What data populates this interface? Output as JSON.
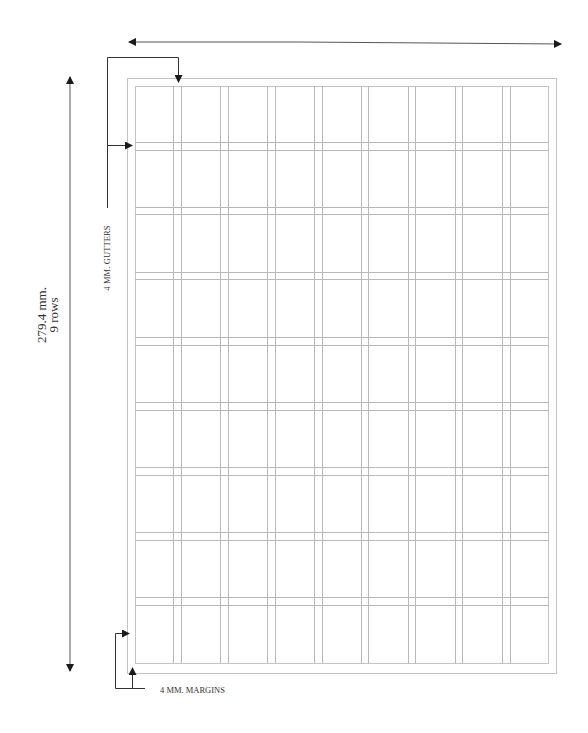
{
  "diagram": {
    "height_dimension": {
      "value_label": "279.4 mm.",
      "rows_label": "9 rows"
    },
    "gutter_annotation": "4 MM. GUTTERS",
    "margin_annotation": "4 MM. MARGINS",
    "grid": {
      "columns": 9,
      "rows": 9
    },
    "colors": {
      "grid_line": "#b8b8b8",
      "page_border": "#c4c4c4",
      "arrow": "#1a1a1a",
      "text": "#333333"
    }
  }
}
